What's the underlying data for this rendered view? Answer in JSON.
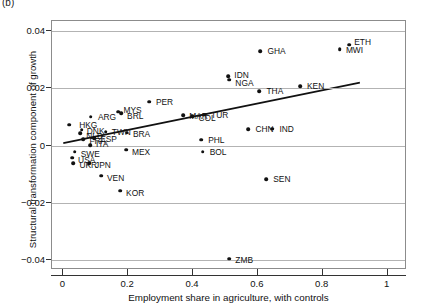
{
  "panel": {
    "tag": "(b)"
  },
  "chart_data": {
    "type": "scatter",
    "title": "",
    "xlabel": "Employment share in agriculture, with controls",
    "ylabel": "Structural transformation component of growth",
    "xlim": [
      -0.035,
      1.06
    ],
    "ylim": [
      -0.0435,
      0.0435
    ],
    "xticks": [
      0,
      0.2,
      0.4,
      0.6,
      0.8,
      1
    ],
    "xtick_labels": [
      "0",
      "0.2",
      "0.4",
      "0.6",
      "0.8",
      "1"
    ],
    "yticks": [
      0.04,
      0.02,
      0,
      -0.02,
      -0.04
    ],
    "ytick_labels": [
      "0.04",
      "0.02",
      "0",
      "−0.02",
      "−0.04"
    ],
    "grid": "horizontal",
    "legend": "none",
    "marker_color": "#111111",
    "gridline_color": "#b3b3b3",
    "frame_color": "#8c8c8c",
    "points": [
      {
        "label": "HKG",
        "x": 0.018,
        "y": 0.0072,
        "lx": 10,
        "ly": 0
      },
      {
        "label": "DNK",
        "x": 0.057,
        "y": 0.0055,
        "lx": 5,
        "ly": 1
      },
      {
        "label": "NLD",
        "x": 0.052,
        "y": 0.0042,
        "lx": 6,
        "ly": 3
      },
      {
        "label": "FRA",
        "x": 0.062,
        "y": 0.0022,
        "lx": 6,
        "ly": 2
      },
      {
        "label": "ESP",
        "x": 0.095,
        "y": 0.0026,
        "lx": 6,
        "ly": 1
      },
      {
        "label": "SWE",
        "x": 0.035,
        "y": -0.0022,
        "lx": 6,
        "ly": 2
      },
      {
        "label": "ITA",
        "x": 0.082,
        "y": 0.0002,
        "lx": 6,
        "ly": -1
      },
      {
        "label": "USA",
        "x": 0.027,
        "y": -0.0042,
        "lx": 6,
        "ly": 2
      },
      {
        "label": "UKR",
        "x": 0.031,
        "y": -0.0062,
        "lx": 6,
        "ly": 2
      },
      {
        "label": "JPN",
        "x": 0.079,
        "y": -0.0062,
        "lx": 6,
        "ly": 2
      },
      {
        "label": "VEN",
        "x": 0.116,
        "y": -0.0105,
        "lx": 6,
        "ly": 2
      },
      {
        "label": "ARG",
        "x": 0.085,
        "y": 0.01,
        "lx": 7,
        "ly": 0
      },
      {
        "label": "TWN",
        "x": 0.131,
        "y": 0.0048,
        "lx": 6,
        "ly": 0
      },
      {
        "label": "MYS",
        "x": 0.17,
        "y": 0.0118,
        "lx": 5,
        "ly": -2
      },
      {
        "label": "BRL",
        "x": 0.178,
        "y": 0.0112,
        "lx": 6,
        "ly": 3
      },
      {
        "label": "BRA",
        "x": 0.196,
        "y": 0.0045,
        "lx": 6,
        "ly": 1
      },
      {
        "label": "MEX",
        "x": 0.193,
        "y": -0.0015,
        "lx": 6,
        "ly": 2
      },
      {
        "label": "KOR",
        "x": 0.175,
        "y": -0.0158,
        "lx": 6,
        "ly": 2
      },
      {
        "label": "PER",
        "x": 0.264,
        "y": 0.0153,
        "lx": 7,
        "ly": 0
      },
      {
        "label": "MAR",
        "x": 0.37,
        "y": 0.0105,
        "lx": 6,
        "ly": 1
      },
      {
        "label": "COL",
        "x": 0.398,
        "y": 0.0103,
        "lx": 6,
        "ly": 2
      },
      {
        "label": "TUR",
        "x": 0.434,
        "y": 0.0108,
        "lx": 7,
        "ly": 0
      },
      {
        "label": "PHL",
        "x": 0.425,
        "y": 0.002,
        "lx": 7,
        "ly": 0
      },
      {
        "label": "BOL",
        "x": 0.43,
        "y": -0.0022,
        "lx": 7,
        "ly": 0
      },
      {
        "label": "IDN",
        "x": 0.509,
        "y": 0.0243,
        "lx": 6,
        "ly": -1
      },
      {
        "label": "NGA",
        "x": 0.512,
        "y": 0.023,
        "lx": 6,
        "ly": 3
      },
      {
        "label": "ZMB",
        "x": 0.512,
        "y": -0.0396,
        "lx": 6,
        "ly": 1
      },
      {
        "label": "CHN",
        "x": 0.571,
        "y": 0.0057,
        "lx": 7,
        "ly": 0
      },
      {
        "label": "SEN",
        "x": 0.626,
        "y": -0.0118,
        "lx": 7,
        "ly": 0
      },
      {
        "label": "THA",
        "x": 0.605,
        "y": 0.019,
        "lx": 7,
        "ly": 0
      },
      {
        "label": "GHA",
        "x": 0.608,
        "y": 0.033,
        "lx": 7,
        "ly": 0
      },
      {
        "label": "IND",
        "x": 0.645,
        "y": 0.0058,
        "lx": 7,
        "ly": 0
      },
      {
        "label": "KEN",
        "x": 0.73,
        "y": 0.0207,
        "lx": 7,
        "ly": 0
      },
      {
        "label": "MWI",
        "x": 0.853,
        "y": 0.0337,
        "lx": 6,
        "ly": 1
      },
      {
        "label": "ETH",
        "x": 0.882,
        "y": 0.0352,
        "lx": 5,
        "ly": -3
      }
    ],
    "trendline": {
      "x0": 0.0,
      "y0": 0.0005,
      "x1": 0.92,
      "y1": 0.0218
    }
  }
}
